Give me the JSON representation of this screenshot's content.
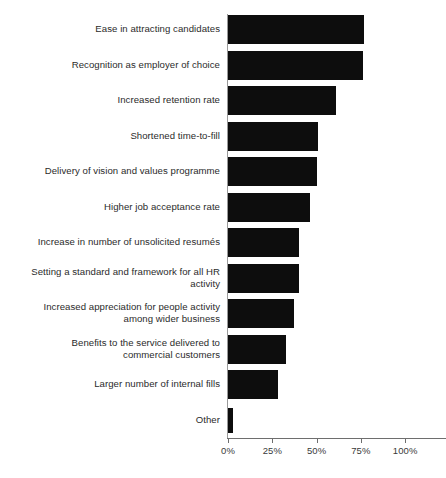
{
  "chart_data": {
    "type": "bar",
    "orientation": "horizontal",
    "title": "",
    "subtitle": "",
    "xlabel": "",
    "ylabel": "",
    "xlim": [
      0,
      125
    ],
    "grid": false,
    "legend": null,
    "axis": {
      "tick_labels": [
        "0%",
        "25%",
        "50%",
        "75%",
        "100%"
      ],
      "tick_values": [
        0,
        25,
        50,
        75,
        100
      ],
      "axis_extends_past_last_tick": true
    },
    "categories": [
      "Ease in attracting candidates",
      "Recognition as employer of choice",
      "Increased retention rate",
      "Shortened time-to-fill",
      "Delivery of vision and values programme",
      "Higher job acceptance rate",
      "Increase in number of unsolicited resumés",
      "Setting a standard and framework for all HR activity",
      "Increased appreciation for people activity among wider business",
      "Benefits to the service delivered to commercial customers",
      "Larger number of internal fills",
      "Other"
    ],
    "values": [
      77,
      76,
      61,
      51,
      50,
      46,
      40,
      40,
      37,
      33,
      28,
      3
    ],
    "bar_color": "#0d0d0d"
  },
  "rows": [
    {
      "label_line1": "Ease in attracting candidates",
      "label_line2": "",
      "value": 77
    },
    {
      "label_line1": "Recognition as employer of choice",
      "label_line2": "",
      "value": 76
    },
    {
      "label_line1": "Increased retention rate",
      "label_line2": "",
      "value": 61
    },
    {
      "label_line1": "Shortened time-to-fill",
      "label_line2": "",
      "value": 51
    },
    {
      "label_line1": "Delivery of vision and values programme",
      "label_line2": "",
      "value": 50
    },
    {
      "label_line1": "Higher job acceptance rate",
      "label_line2": "",
      "value": 46
    },
    {
      "label_line1": "Increase in number of unsolicited resumés",
      "label_line2": "",
      "value": 40
    },
    {
      "label_line1": "Setting a standard and framework for all HR",
      "label_line2": "activity",
      "value": 40
    },
    {
      "label_line1": "Increased appreciation for people activity",
      "label_line2": "among wider business",
      "value": 37
    },
    {
      "label_line1": "Benefits to the service delivered to",
      "label_line2": "commercial customers",
      "value": 33
    },
    {
      "label_line1": "Larger number of internal fills",
      "label_line2": "",
      "value": 28
    },
    {
      "label_line1": "Other",
      "label_line2": "",
      "value": 3
    }
  ],
  "ticks": [
    {
      "label": "0%",
      "value": 0
    },
    {
      "label": "25%",
      "value": 25
    },
    {
      "label": "50%",
      "value": 50
    },
    {
      "label": "75%",
      "value": 75
    },
    {
      "label": "100%",
      "value": 100
    }
  ]
}
